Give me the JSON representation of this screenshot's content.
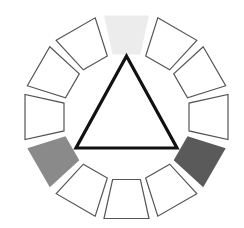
{
  "diagram": {
    "type": "color-wheel-triad",
    "center": [
      126.5,
      117
    ],
    "inner_radius": 64,
    "outer_radius": 104,
    "segment_count": 12,
    "segment_half_angle_deg": 12.5,
    "outline_color": "#555555",
    "segments": [
      {
        "index": 0,
        "angle_deg": 0,
        "fill": "#ececec",
        "stroke": "none",
        "highlighted": true
      },
      {
        "index": 1,
        "angle_deg": 30,
        "fill": "#ffffff",
        "stroke": "#555555",
        "highlighted": false
      },
      {
        "index": 2,
        "angle_deg": 60,
        "fill": "#ffffff",
        "stroke": "#555555",
        "highlighted": false
      },
      {
        "index": 3,
        "angle_deg": 90,
        "fill": "#ffffff",
        "stroke": "#555555",
        "highlighted": false
      },
      {
        "index": 4,
        "angle_deg": 120,
        "fill": "#5a5a5a",
        "stroke": "none",
        "highlighted": true
      },
      {
        "index": 5,
        "angle_deg": 150,
        "fill": "#ffffff",
        "stroke": "#555555",
        "highlighted": false
      },
      {
        "index": 6,
        "angle_deg": 180,
        "fill": "#ffffff",
        "stroke": "#555555",
        "highlighted": false
      },
      {
        "index": 7,
        "angle_deg": 210,
        "fill": "#ffffff",
        "stroke": "#555555",
        "highlighted": false
      },
      {
        "index": 8,
        "angle_deg": 240,
        "fill": "#8a8a8a",
        "stroke": "none",
        "highlighted": true
      },
      {
        "index": 9,
        "angle_deg": 270,
        "fill": "#ffffff",
        "stroke": "#555555",
        "highlighted": false
      },
      {
        "index": 10,
        "angle_deg": 300,
        "fill": "#ffffff",
        "stroke": "#555555",
        "highlighted": false
      },
      {
        "index": 11,
        "angle_deg": 330,
        "fill": "#ffffff",
        "stroke": "#555555",
        "highlighted": false
      }
    ],
    "triangle": {
      "points": [
        [
          126.5,
          56
        ],
        [
          76,
          148
        ],
        [
          177,
          148
        ]
      ],
      "stroke": "#111111",
      "stroke_width": 3.2
    }
  }
}
